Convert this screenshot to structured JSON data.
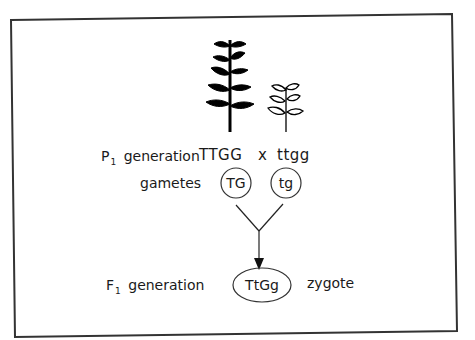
{
  "figure": {
    "type": "monohybrid/dihybrid cross diagram",
    "frame_color": "#333333",
    "plants": [
      {
        "name": "tall-plant",
        "style": "filled",
        "color": "#000000"
      },
      {
        "name": "short-plant",
        "style": "outline",
        "color": "#000000"
      }
    ],
    "p1": {
      "label_main": "P",
      "label_sub": "1",
      "label_rest": " generation",
      "parent1_genotype": "TTGG",
      "cross_symbol": "x",
      "parent2_genotype": "ttgg"
    },
    "gametes": {
      "label": "gametes",
      "gamete1": "TG",
      "gamete2": "tg"
    },
    "f1": {
      "label_main": "F",
      "label_sub": "1",
      "label_rest": " generation",
      "genotype": "TtGg",
      "note": "zygote"
    }
  }
}
